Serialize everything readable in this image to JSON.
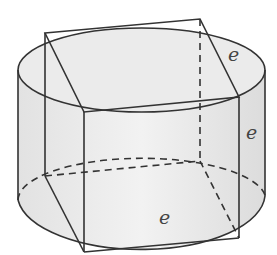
{
  "figure": {
    "labels": {
      "top_edge": "e",
      "vertical_edge": "e",
      "bottom_edge": "e"
    },
    "colors": {
      "stroke": "#333333",
      "fill": "#eeeeee",
      "fill_light": "#f5f5f5"
    }
  }
}
